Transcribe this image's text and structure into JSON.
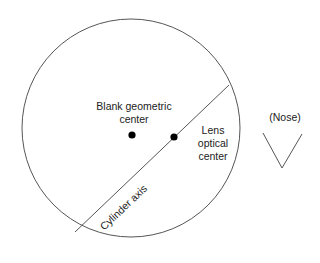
{
  "diagram": {
    "labels": {
      "blank_center": [
        "Blank geometric",
        "center"
      ],
      "optical_center": [
        "Lens",
        "optical",
        "center"
      ],
      "cylinder_axis": "Cylinder axis",
      "nose": "(Nose)"
    },
    "colors": {
      "stroke": "#555555",
      "dot": "#000000",
      "text": "#222222"
    }
  }
}
